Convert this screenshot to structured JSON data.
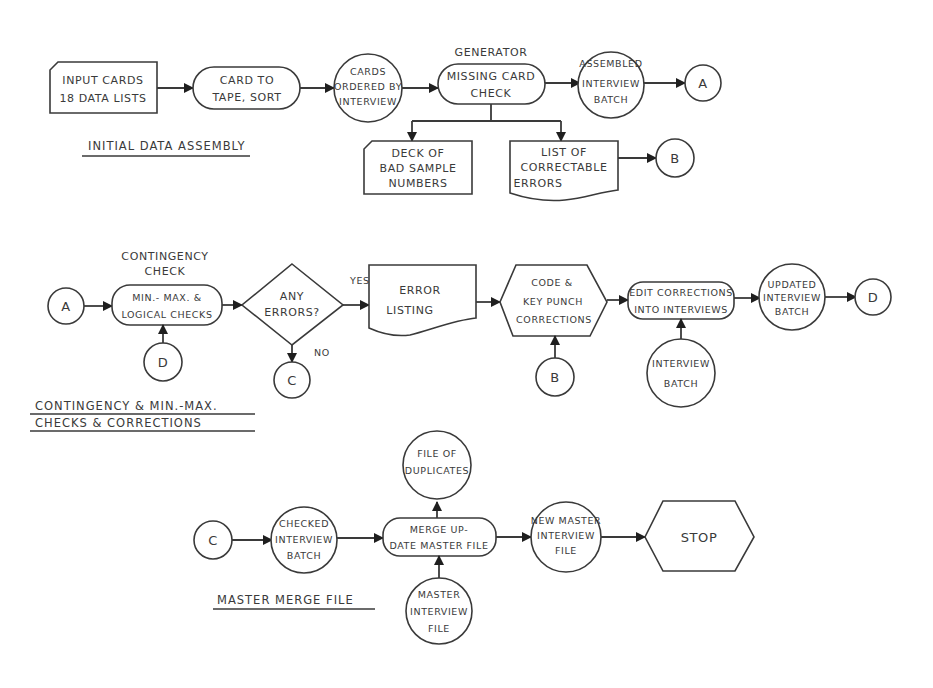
{
  "sections": {
    "initial": "INITIAL DATA ASSEMBLY",
    "contingency": [
      "CONTINGENCY & MIN.-MAX.",
      "CHECKS & CORRECTIONS"
    ],
    "master": "MASTER MERGE FILE"
  },
  "nodes": {
    "input_cards": [
      "INPUT CARDS",
      "18 DATA LISTS"
    ],
    "card_to_tape": [
      "CARD TO",
      "TAPE, SORT"
    ],
    "cards_ordered": [
      "CARDS",
      "ORDERED BY",
      "INTERVIEW"
    ],
    "generator_caption": "GENERATOR",
    "missing_card_check": [
      "MISSING CARD",
      "CHECK"
    ],
    "assembled_batch": [
      "ASSEMBLED",
      "INTERVIEW",
      "BATCH"
    ],
    "deck_bad_samples": [
      "DECK OF",
      "BAD SAMPLE",
      "NUMBERS"
    ],
    "list_correctable": [
      "LIST OF",
      "CORRECTABLE",
      "ERRORS"
    ],
    "contingency_caption": [
      "CONTINGENCY",
      "CHECK"
    ],
    "minmax_checks": [
      "MIN.- MAX. &",
      "LOGICAL CHECKS"
    ],
    "any_errors": [
      "ANY",
      "ERRORS?"
    ],
    "error_listing": [
      "ERROR",
      "LISTING"
    ],
    "code_keypunch": [
      "CODE &",
      "KEY PUNCH",
      "CORRECTIONS"
    ],
    "edit_corrections": [
      "EDIT CORRECTIONS",
      "INTO INTERVIEWS"
    ],
    "interview_batch": [
      "INTERVIEW",
      "BATCH"
    ],
    "updated_batch": [
      "UPDATED",
      "INTERVIEW",
      "BATCH"
    ],
    "checked_batch": [
      "CHECKED",
      "INTERVIEW",
      "BATCH"
    ],
    "merge_update": [
      "MERGE UP-",
      "DATE MASTER FILE"
    ],
    "file_duplicates": [
      "FILE OF",
      "DUPLICATES"
    ],
    "master_interview_file": [
      "MASTER",
      "INTERVIEW",
      "FILE"
    ],
    "new_master_file": [
      "NEW MASTER",
      "INTERVIEW",
      "FILE"
    ],
    "stop": "STOP"
  },
  "connectors": {
    "A": "A",
    "B": "B",
    "C": "C",
    "D": "D"
  },
  "edge_labels": {
    "yes": "YES",
    "no": "NO"
  }
}
